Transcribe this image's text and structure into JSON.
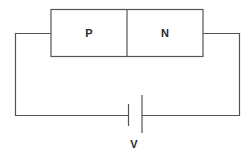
{
  "diagram": {
    "regions": [
      {
        "label": "P"
      },
      {
        "label": "N"
      }
    ],
    "battery": {
      "label": "V"
    },
    "colors": {
      "line": "#555555",
      "text": "#2a2a2a",
      "background": "#ffffff"
    }
  }
}
